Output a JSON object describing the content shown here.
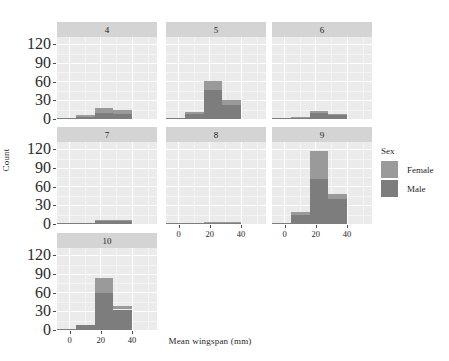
{
  "chart_data": {
    "type": "bar",
    "title": "",
    "subtitle": "",
    "xlabel": "Mean wingspan (mm)",
    "ylabel": "Count",
    "grid": true,
    "legend_position": "right",
    "legend_title": "Sex",
    "series": [
      {
        "name": "Female",
        "color": "#9a9a9a"
      },
      {
        "name": "Male",
        "color": "#7d7d7d"
      }
    ],
    "xlim": [
      -8,
      56
    ],
    "ylim": [
      0,
      132
    ],
    "yticks": [
      0,
      30,
      60,
      90,
      120
    ],
    "xticks": [
      0,
      20,
      40
    ],
    "bin_width": 12,
    "bin_starts": [
      -8,
      4,
      16,
      28,
      40
    ],
    "facet_variable": "",
    "facets": [
      {
        "label": "4",
        "row": 0,
        "col": 0,
        "bins": [
          {
            "x0": -8,
            "x1": 4,
            "female": 0,
            "male": 2,
            "total": 2
          },
          {
            "x0": 4,
            "x1": 16,
            "female": 2,
            "male": 4,
            "total": 6
          },
          {
            "x0": 16,
            "x1": 28,
            "female": 8,
            "male": 10,
            "total": 18
          },
          {
            "x0": 28,
            "x1": 40,
            "female": 6,
            "male": 8,
            "total": 14
          },
          {
            "x0": 40,
            "x1": 52,
            "female": 0,
            "male": 0,
            "total": 0
          }
        ]
      },
      {
        "label": "5",
        "row": 0,
        "col": 1,
        "bins": [
          {
            "x0": -8,
            "x1": 4,
            "female": 0,
            "male": 2,
            "total": 2
          },
          {
            "x0": 4,
            "x1": 16,
            "female": 3,
            "male": 8,
            "total": 11
          },
          {
            "x0": 16,
            "x1": 28,
            "female": 14,
            "male": 47,
            "total": 61
          },
          {
            "x0": 28,
            "x1": 40,
            "female": 7,
            "male": 23,
            "total": 30
          },
          {
            "x0": 40,
            "x1": 52,
            "female": 0,
            "male": 0,
            "total": 0
          }
        ]
      },
      {
        "label": "6",
        "row": 0,
        "col": 2,
        "bins": [
          {
            "x0": -8,
            "x1": 4,
            "female": 0,
            "male": 1,
            "total": 1
          },
          {
            "x0": 4,
            "x1": 16,
            "female": 1,
            "male": 3,
            "total": 4
          },
          {
            "x0": 16,
            "x1": 28,
            "female": 4,
            "male": 9,
            "total": 13
          },
          {
            "x0": 28,
            "x1": 40,
            "female": 2,
            "male": 6,
            "total": 8
          },
          {
            "x0": 40,
            "x1": 52,
            "female": 0,
            "male": 0,
            "total": 0
          }
        ]
      },
      {
        "label": "7",
        "row": 1,
        "col": 0,
        "bins": [
          {
            "x0": -8,
            "x1": 4,
            "female": 0,
            "male": 2,
            "total": 2
          },
          {
            "x0": 4,
            "x1": 16,
            "female": 0,
            "male": 2,
            "total": 2
          },
          {
            "x0": 16,
            "x1": 28,
            "female": 2,
            "male": 5,
            "total": 7
          },
          {
            "x0": 28,
            "x1": 40,
            "female": 2,
            "male": 5,
            "total": 7
          },
          {
            "x0": 40,
            "x1": 52,
            "female": 0,
            "male": 0,
            "total": 0
          }
        ]
      },
      {
        "label": "8",
        "row": 1,
        "col": 1,
        "bins": [
          {
            "x0": -8,
            "x1": 4,
            "female": 0,
            "male": 1,
            "total": 1
          },
          {
            "x0": 4,
            "x1": 16,
            "female": 0,
            "male": 1,
            "total": 1
          },
          {
            "x0": 16,
            "x1": 28,
            "female": 1,
            "male": 3,
            "total": 4
          },
          {
            "x0": 28,
            "x1": 40,
            "female": 1,
            "male": 3,
            "total": 4
          },
          {
            "x0": 40,
            "x1": 52,
            "female": 0,
            "male": 0,
            "total": 0
          }
        ]
      },
      {
        "label": "9",
        "row": 1,
        "col": 2,
        "bins": [
          {
            "x0": -8,
            "x1": 4,
            "female": 0,
            "male": 1,
            "total": 1
          },
          {
            "x0": 4,
            "x1": 16,
            "female": 5,
            "male": 15,
            "total": 20
          },
          {
            "x0": 16,
            "x1": 28,
            "female": 46,
            "male": 72,
            "total": 118
          },
          {
            "x0": 28,
            "x1": 40,
            "female": 8,
            "male": 40,
            "total": 48
          },
          {
            "x0": 40,
            "x1": 52,
            "female": 0,
            "male": 0,
            "total": 0
          }
        ]
      },
      {
        "label": "10",
        "row": 2,
        "col": 0,
        "bins": [
          {
            "x0": -8,
            "x1": 4,
            "female": 0,
            "male": 2,
            "total": 2
          },
          {
            "x0": 4,
            "x1": 16,
            "female": 0,
            "male": 8,
            "total": 8
          },
          {
            "x0": 16,
            "x1": 28,
            "female": 23,
            "male": 60,
            "total": 83
          },
          {
            "x0": 28,
            "x1": 40,
            "female": 6,
            "male": 33,
            "total": 39
          },
          {
            "x0": 40,
            "x1": 52,
            "female": 0,
            "male": 0,
            "total": 0
          }
        ]
      }
    ]
  },
  "legend": {
    "title": "Sex",
    "items": [
      {
        "label": "Female",
        "color": "#9a9a9a"
      },
      {
        "label": "Male",
        "color": "#7d7d7d"
      }
    ]
  },
  "axes": {
    "x_title": "Mean wingspan (mm)",
    "y_title": "Count",
    "y_tick_labels": [
      "0",
      "30",
      "60",
      "90",
      "120"
    ],
    "x_tick_labels": [
      "0",
      "20",
      "40"
    ]
  }
}
